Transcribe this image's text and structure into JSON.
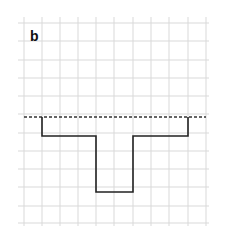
{
  "panel_label": "b",
  "grid": {
    "x_lines": [
      24,
      42,
      60,
      78,
      96,
      114,
      133,
      151,
      169,
      188,
      206
    ],
    "y_lines": [
      23,
      41,
      60,
      78,
      96,
      114,
      133,
      151,
      169,
      187,
      206,
      223
    ],
    "color": "#d9d9d9"
  },
  "reference_line": {
    "style": "dashed",
    "y": 117,
    "x_start": 24,
    "x_end": 206,
    "color": "#333333"
  },
  "profile": {
    "style": "solid",
    "color": "#222222",
    "points": [
      [
        42,
        117
      ],
      [
        42,
        136
      ],
      [
        96,
        136
      ],
      [
        96,
        192
      ],
      [
        133,
        192
      ],
      [
        133,
        136
      ],
      [
        188,
        136
      ],
      [
        188,
        117
      ]
    ]
  }
}
